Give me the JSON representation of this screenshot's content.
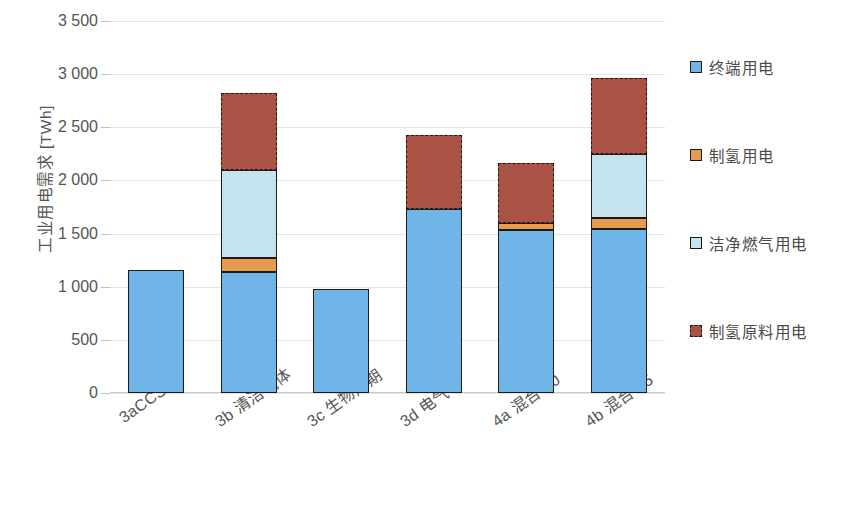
{
  "chart_data": {
    "type": "bar",
    "stacked": true,
    "title": "",
    "xlabel": "",
    "ylabel": "工业用电需求 [TWh]",
    "ylim": [
      0,
      3500
    ],
    "ytick_step": 500,
    "ytick_labels": [
      "3 500",
      "3 000",
      "2 500",
      "2 000",
      "1 500",
      "1 000",
      "500",
      "0"
    ],
    "ytick_values": [
      3500,
      3000,
      2500,
      2000,
      1500,
      1000,
      500,
      0
    ],
    "grid": true,
    "legend_position": "right",
    "categories": [
      "3aCCS",
      "3b 清洁气体",
      "3c 生物周期",
      "3d 电气",
      "4a 混合 80",
      "4b 混合 95"
    ],
    "series": [
      {
        "name": "终端用电",
        "color": "#70b5e8",
        "values": [
          1160,
          1140,
          980,
          1730,
          1530,
          1540
        ]
      },
      {
        "name": "制氢用电",
        "color": "#e89a4f",
        "values": [
          0,
          130,
          0,
          0,
          70,
          110
        ]
      },
      {
        "name": "洁净燃气用电",
        "color": "#c5e3ee",
        "values": [
          0,
          830,
          0,
          0,
          0,
          600
        ]
      },
      {
        "name": "制氢原料用电",
        "color": "#a85343",
        "values": [
          0,
          720,
          0,
          700,
          560,
          710
        ]
      }
    ],
    "totals": [
      1160,
      2820,
      980,
      2430,
      2160,
      2960
    ]
  },
  "axis": {
    "y_title": "工业用电需求 [TWh]"
  },
  "legend": {
    "items": [
      {
        "label": "终端用电"
      },
      {
        "label": "制氢用电"
      },
      {
        "label": "洁净燃气用电"
      },
      {
        "label": "制氢原料用电"
      }
    ]
  }
}
